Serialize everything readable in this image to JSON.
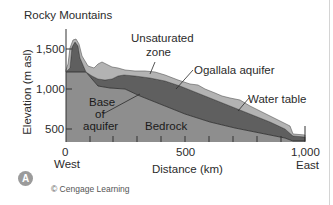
{
  "figure": {
    "labels": {
      "rocky_mountains": "Rocky Mountains",
      "unsaturated_zone_line1": "Unsaturated",
      "unsaturated_zone_line2": "zone",
      "ogallala_aquifer": "Ogallala aquifer",
      "water_table": "Water table",
      "base_of_aquifer_line1": "Base",
      "base_of_aquifer_line2": "of",
      "base_of_aquifer_line3": "aquifer",
      "bedrock": "Bedrock"
    },
    "y_axis": {
      "label": "Elevation (m asl)",
      "ticks": [
        "1,500",
        "1,000",
        "500"
      ]
    },
    "x_axis": {
      "label": "Distance (km)",
      "ticks": [
        "0",
        "500",
        "1,000"
      ],
      "west": "West",
      "east": "East"
    },
    "panel_badge": "A",
    "credit": "© Cengage Learning",
    "colors": {
      "bedrock": "#8e8e8e",
      "aquifer": "#5f5f5f",
      "unsaturated": "#b3b3b3",
      "outline": "#2a2a2a"
    }
  }
}
